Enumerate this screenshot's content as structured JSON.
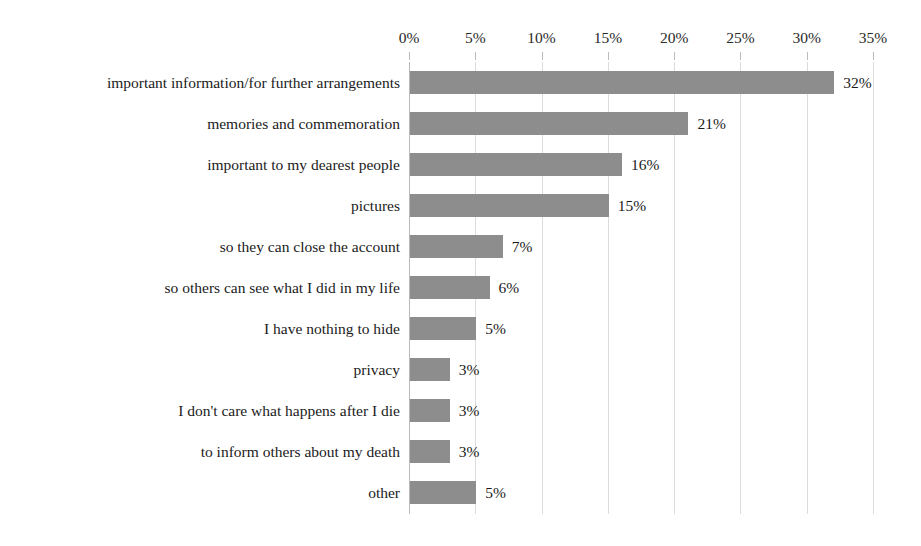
{
  "chart_data": {
    "type": "bar",
    "orientation": "horizontal",
    "title": "",
    "subtitle": "",
    "xlabel": "",
    "ylabel": "",
    "xlim": [
      0,
      35
    ],
    "grid": true,
    "legend": false,
    "legend_position": "none",
    "axis_position": "top",
    "bar_color": "#8d8d8d",
    "gridline_color": "#dcdcdc",
    "background_color": "#ffffff",
    "text_color": "#1b1b1b",
    "x_tick_labels": [
      "0%",
      "5%",
      "10%",
      "15%",
      "20%",
      "25%",
      "30%",
      "35%"
    ],
    "x_tick_values": [
      0,
      5,
      10,
      15,
      20,
      25,
      30,
      35
    ],
    "categories": [
      "important information/for further arrangements",
      "memories and commemoration",
      "important to my dearest people",
      "pictures",
      "so they can close the account",
      "so others can see what I did in my life",
      "I have nothing to hide",
      "privacy",
      "I don't care what happens after I die",
      "to inform others about my death",
      "other"
    ],
    "values": [
      32,
      21,
      16,
      15,
      7,
      6,
      5,
      3,
      3,
      3,
      5
    ],
    "data_labels": [
      "32%",
      "21%",
      "16%",
      "15%",
      "7%",
      "6%",
      "5%",
      "3%",
      "3%",
      "3%",
      "5%"
    ]
  }
}
